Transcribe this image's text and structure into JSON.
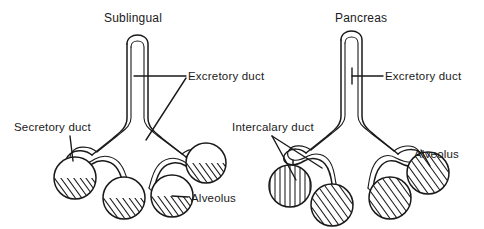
{
  "figure": {
    "kind": "anatomical-diagram",
    "background_color": "#ffffff",
    "ink_color": "#1a1a1a"
  },
  "panels": [
    {
      "id": "sublingual",
      "title": "Sublingual",
      "title_position": {
        "x": 104,
        "y": 22
      },
      "labels": [
        {
          "id": "excretory-duct-left",
          "text": "Excretory duct",
          "x": 188,
          "y": 80,
          "anchor": "start"
        },
        {
          "id": "secretory-duct",
          "text": "Secretory duct",
          "x": 14,
          "y": 131,
          "anchor": "start"
        },
        {
          "id": "alveolus-left",
          "text": "Alveolus",
          "x": 191,
          "y": 202,
          "anchor": "start"
        }
      ],
      "alveoli_count": 4,
      "alveolus_style": "partially-hatched"
    },
    {
      "id": "pancreas",
      "title": "Pancreas",
      "title_position": {
        "x": 335,
        "y": 22
      },
      "labels": [
        {
          "id": "excretory-duct-right",
          "text": "Excretory duct",
          "x": 385,
          "y": 80,
          "anchor": "start"
        },
        {
          "id": "intercalary-duct",
          "text": "Intercalary duct",
          "x": 232,
          "y": 131,
          "anchor": "start"
        },
        {
          "id": "alveolus-right",
          "text": "Alveolus",
          "x": 414,
          "y": 158,
          "anchor": "start"
        }
      ],
      "alveoli_count": 4,
      "alveolus_style": "fully-hatched"
    }
  ]
}
